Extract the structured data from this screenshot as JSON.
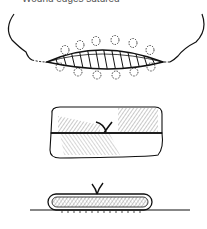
{
  "figure": {
    "caption_partial": "Wound edges sutured",
    "panels": [
      {
        "id": "top",
        "description": "Lens-shaped wound defect with hatching, surrounded by skin outline and dashed suture loops"
      },
      {
        "id": "middle",
        "description": "Two stacked tissue layers, cross-hatched, with suture knot at junction"
      },
      {
        "id": "bottom",
        "description": "Flattened rounded tissue pad with cross-hatching resting on a base line, knot on top"
      }
    ],
    "colors": {
      "line": "#111111",
      "hatch": "#666666",
      "background": "#ffffff"
    }
  }
}
